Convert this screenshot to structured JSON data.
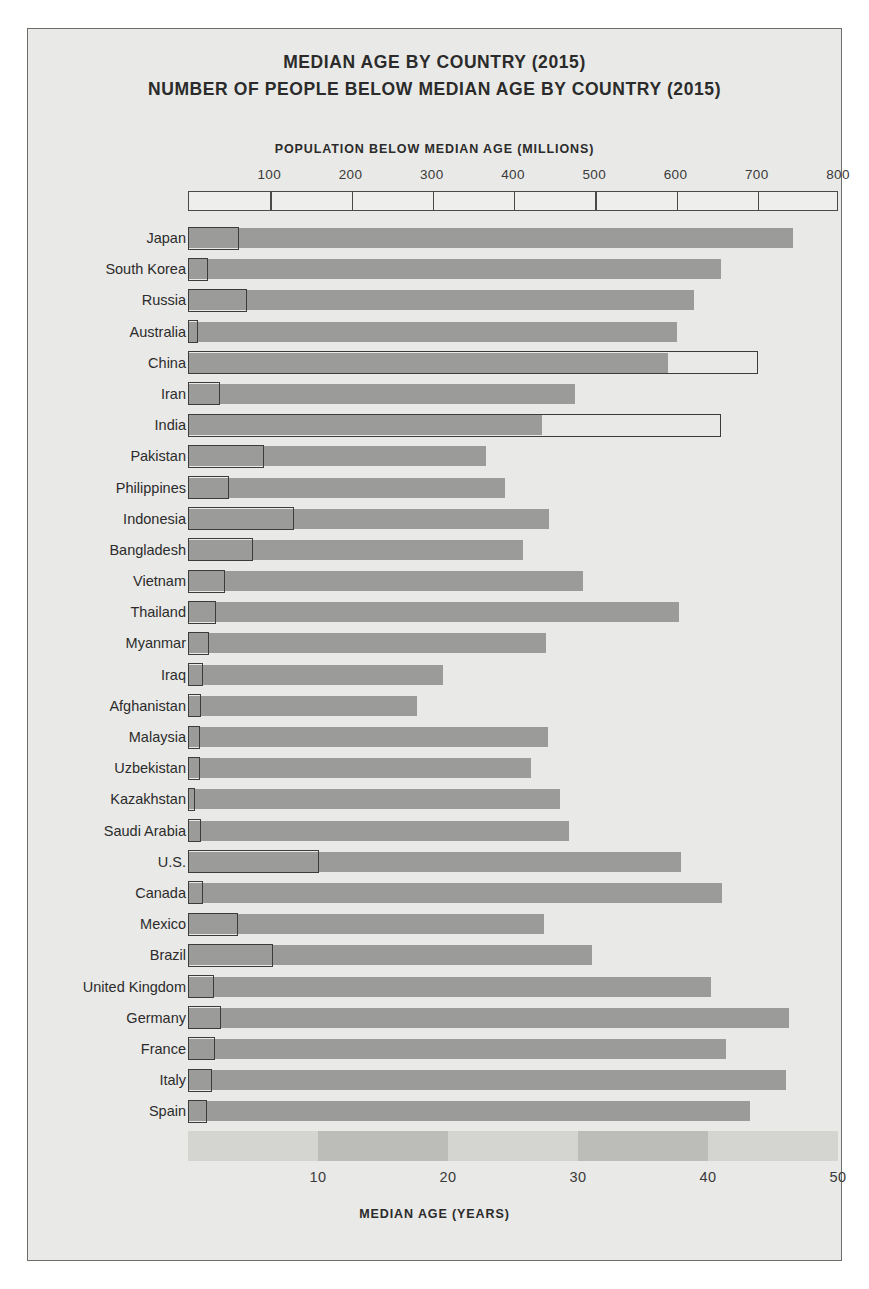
{
  "titles": {
    "line1": "MEDIAN AGE BY COUNTRY (2015)",
    "line2": "NUMBER OF PEOPLE BELOW MEDIAN AGE BY COUNTRY (2015)"
  },
  "axes": {
    "top_label": "POPULATION BELOW MEDIAN AGE (MILLIONS)",
    "bottom_label": "MEDIAN AGE (YEARS)",
    "top_ticks": [
      "100",
      "200",
      "300",
      "400",
      "500",
      "600",
      "700",
      "800"
    ],
    "bottom_ticks": [
      "10",
      "20",
      "30",
      "40",
      "50"
    ]
  },
  "colors": {
    "page_background": "#ffffff",
    "figure_background": "#e9e9e7",
    "frame": "#6d6d6a",
    "age_bar_fill": "#9b9b99",
    "pop_box_stroke": "#3c3c3a",
    "band_light": "#d4d4d1",
    "band_dark": "#bcbcb9",
    "text": "#2b2b2b"
  },
  "chart_data": {
    "type": "bar",
    "orientation": "horizontal",
    "grid": false,
    "legend": "none",
    "xlabel": "MEDIAN AGE (YEARS)",
    "xlabel_top": "POPULATION BELOW MEDIAN AGE (MILLIONS)",
    "ylabel": "",
    "xlim_bottom": [
      0,
      50
    ],
    "xlim_top": [
      0,
      800
    ],
    "bottom_ticks": [
      10,
      20,
      30,
      40,
      50
    ],
    "top_ticks": [
      100,
      200,
      300,
      400,
      500,
      600,
      700,
      800
    ],
    "categories": [
      "Japan",
      "South Korea",
      "Russia",
      "Australia",
      "China",
      "Iran",
      "India",
      "Pakistan",
      "Philippines",
      "Indonesia",
      "Bangladesh",
      "Vietnam",
      "Thailand",
      "Myanmar",
      "Iraq",
      "Afghanistan",
      "Malaysia",
      "Uzbekistan",
      "Kazakhstan",
      "Saudi Arabia",
      "U.S.",
      "Canada",
      "Mexico",
      "Brazil",
      "United Kingdom",
      "Germany",
      "France",
      "Italy",
      "Spain"
    ],
    "series": [
      {
        "name": "Median age (years)",
        "units": "years",
        "scale": "bottom",
        "values": [
          46.5,
          41.0,
          38.9,
          37.6,
          36.9,
          29.8,
          27.2,
          22.9,
          24.4,
          27.8,
          25.8,
          30.4,
          37.8,
          27.5,
          19.6,
          17.6,
          27.7,
          26.4,
          28.6,
          29.3,
          37.9,
          41.1,
          27.4,
          31.1,
          40.2,
          46.2,
          41.4,
          46.0,
          43.2
        ]
      },
      {
        "name": "Population below median age (millions)",
        "units": "millions",
        "scale": "top",
        "values": [
          63,
          25,
          72,
          12,
          701,
          39,
          656,
          94,
          51,
          131,
          80,
          45,
          34,
          26,
          19,
          16,
          15,
          15,
          9,
          16,
          161,
          18,
          62,
          104,
          32,
          41,
          33,
          30,
          23
        ]
      }
    ]
  }
}
